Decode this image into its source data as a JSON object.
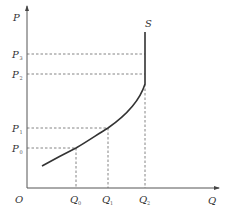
{
  "diagram": {
    "colors": {
      "axis": "#555555",
      "curve": "#333333",
      "guide": "#666666",
      "label": "#333333"
    },
    "axes": {
      "y_label": "P",
      "x_label": "Q",
      "origin_label": "O"
    },
    "curve": {
      "label": "S"
    },
    "price_levels": [
      {
        "id": "P3",
        "main": "P",
        "sub": "3"
      },
      {
        "id": "P2",
        "main": "P",
        "sub": "2"
      },
      {
        "id": "P1",
        "main": "P",
        "sub": "1"
      },
      {
        "id": "P0",
        "main": "P",
        "sub": "0"
      }
    ],
    "quantity_levels": [
      {
        "id": "Q0",
        "main": "Q",
        "sub": "0"
      },
      {
        "id": "Q1",
        "main": "Q",
        "sub": "1"
      },
      {
        "id": "Q2",
        "main": "Q",
        "sub": "2"
      }
    ]
  }
}
